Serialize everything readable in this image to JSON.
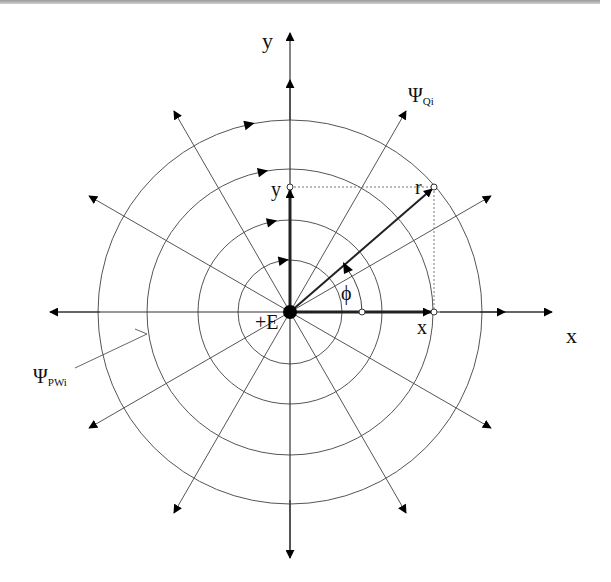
{
  "figure": {
    "type": "polar-field-diagram",
    "center": {
      "x": 290,
      "y": 312
    },
    "circle_radii": [
      52,
      92,
      143,
      192
    ],
    "radial_angles_deg": [
      0,
      30,
      60,
      90,
      120,
      150,
      180,
      210,
      240,
      270,
      300,
      330
    ],
    "colors": {
      "line": "#555555",
      "arrow": "#000000",
      "axis": "#333333",
      "background": "#ffffff"
    }
  },
  "labels": {
    "y_axis": "y",
    "x_axis": "x",
    "y_point": "y",
    "x_point": "x",
    "r_point": "r",
    "phi": "ϕ",
    "charge": "+E",
    "psi_q": {
      "symbol": "Ψ",
      "subscript": "Qi"
    },
    "psi_pw": {
      "symbol": "Ψ",
      "subscript": "PWi"
    }
  }
}
